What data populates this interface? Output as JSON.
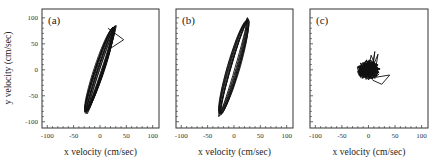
{
  "chart_data": [
    {
      "type": "line",
      "panel": "(a)",
      "title": "",
      "xlabel": "x velocity (cm/sec)",
      "ylabel": "y velocity (cm/sec)",
      "xlim": [
        -110,
        112
      ],
      "ylim": [
        -112,
        117
      ],
      "xticks": [
        -100,
        -50,
        0,
        50,
        100
      ],
      "yticks": [
        -100,
        -50,
        0,
        50,
        100
      ],
      "grid": false,
      "description": "Dense elongated elliptical loops along a diagonal, with an excursion loop to the upper right",
      "loops": {
        "cx": 0,
        "cy": 0,
        "angle_deg": 72,
        "semi_major": 90,
        "semi_minor": [
          3,
          10
        ],
        "count": 14
      },
      "excursion": [
        [
          15,
          80
        ],
        [
          45,
          58
        ],
        [
          18,
          40
        ]
      ]
    },
    {
      "type": "line",
      "panel": "(b)",
      "title": "",
      "xlabel": "x velocity (cm/sec)",
      "ylabel": "",
      "xlim": [
        -110,
        112
      ],
      "ylim": [
        -112,
        117
      ],
      "xticks": [
        -100,
        -50,
        0,
        50,
        100
      ],
      "yticks": [
        -100,
        -50,
        0,
        50,
        100
      ],
      "grid": false,
      "description": "Set of nested thin elongated elliptical loops along a steep diagonal",
      "loops": {
        "cx": 0,
        "cy": 5,
        "angle_deg": 74,
        "semi_major": 100,
        "semi_minor": [
          3,
          12
        ],
        "count": 9
      },
      "excursion": []
    },
    {
      "type": "line",
      "panel": "(c)",
      "title": "",
      "xlabel": "x velocity (cm/sec)",
      "ylabel": "",
      "xlim": [
        -110,
        112
      ],
      "ylim": [
        -112,
        117
      ],
      "xticks": [
        -100,
        -50,
        0,
        50,
        100
      ],
      "yticks": [
        -100,
        -50,
        0,
        50,
        100
      ],
      "grid": false,
      "description": "Tangled compact cluster centered near origin with a small excursion to lower right",
      "cluster": {
        "cx": 0,
        "cy": 0,
        "radius": 22
      },
      "excursion": [
        [
          10,
          -15
        ],
        [
          40,
          -10
        ],
        [
          25,
          -28
        ],
        [
          8,
          -20
        ]
      ]
    }
  ],
  "labels": {
    "panel_a": "(a)",
    "panel_b": "(b)",
    "panel_c": "(c)",
    "xlabel": "x velocity (cm/sec)",
    "ylabel": "y velocity (cm/sec)",
    "tick_labels": [
      "-100",
      "-50",
      "0",
      "50",
      "100"
    ]
  }
}
